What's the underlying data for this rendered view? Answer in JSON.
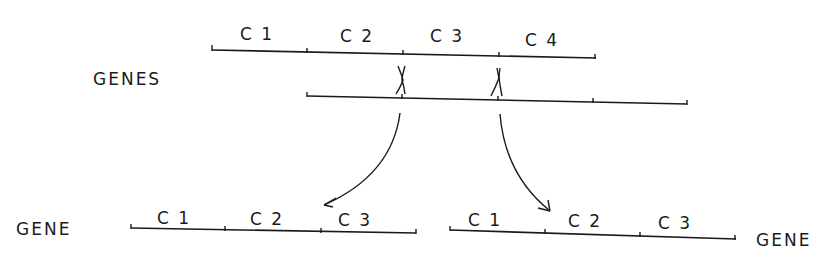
{
  "diagram": {
    "top_chromosome": {
      "label": "GENES",
      "upper_gene": {
        "segments": [
          "C 1",
          "C 2",
          "C 3",
          "C 4"
        ]
      },
      "lower_gene": {
        "segments": [
          "",
          "",
          "",
          ""
        ]
      },
      "crossover_marks": [
        "X",
        "X"
      ]
    },
    "product_left": {
      "label": "GENE",
      "segments": [
        "C 1",
        "C 2",
        "C 3"
      ]
    },
    "product_right": {
      "label": "GENE",
      "segments": [
        "C 1",
        "C 2",
        "C 3"
      ]
    },
    "page_number_fragment": "45"
  }
}
